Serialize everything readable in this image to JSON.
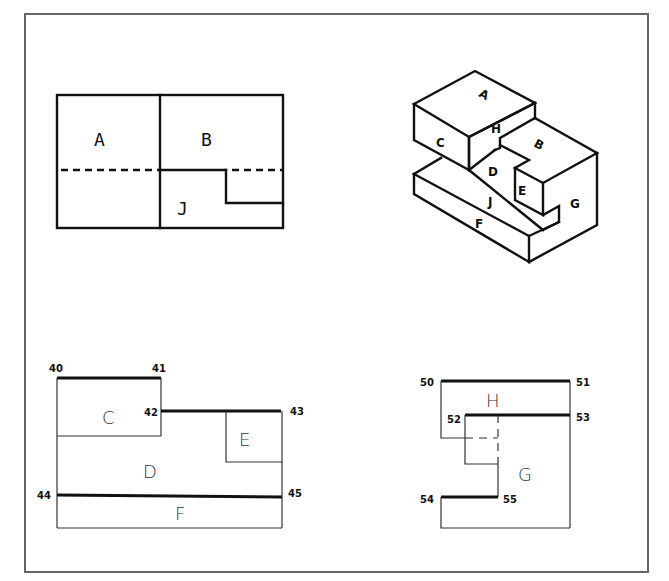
{
  "top_view": {
    "labels": {
      "A": "A",
      "B": "B",
      "J": "J"
    }
  },
  "isometric_view": {
    "labels": {
      "A": "A",
      "B": "B",
      "C": "C",
      "D": "D",
      "E": "E",
      "F": "F",
      "G": "G",
      "H": "H",
      "J": "J"
    }
  },
  "front_view": {
    "labels": {
      "C": "C",
      "D": "D",
      "E": "E",
      "F": "F"
    },
    "points": {
      "p40": "40",
      "p41": "41",
      "p42": "42",
      "p43": "43",
      "p44": "44",
      "p45": "45"
    }
  },
  "side_view": {
    "labels": {
      "H": "H",
      "G": "G"
    },
    "points": {
      "p50": "50",
      "p51": "51",
      "p52": "52",
      "p53": "53",
      "p54": "54",
      "p55": "55"
    }
  }
}
